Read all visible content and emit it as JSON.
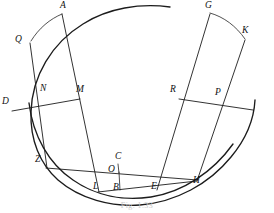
{
  "figure": {
    "caption": "Fig. 1.33",
    "stroke_color": "#1c1c1c",
    "background_color": "#ffffff",
    "width": 274,
    "height": 213
  },
  "points": [
    {
      "id": "A",
      "label": "A",
      "x": 62,
      "y": 133,
      "lx": 60,
      "ly": 2
    },
    {
      "id": "Q",
      "label": "Q",
      "x": 30,
      "y": 111,
      "lx": 17,
      "ly": 37
    },
    {
      "id": "D",
      "label": "D",
      "x": 11,
      "y": 79,
      "lx": 3,
      "ly": 97
    },
    {
      "id": "N",
      "label": "N",
      "x": 46,
      "y": 82,
      "lx": 41,
      "ly": 85
    },
    {
      "id": "M",
      "label": "M",
      "x": 79,
      "y": 85,
      "lx": 78,
      "ly": 85
    },
    {
      "id": "Z",
      "label": "Z",
      "x": 43,
      "y": 29,
      "lx": 36,
      "ly": 156
    },
    {
      "id": "L",
      "label": "L",
      "x": 98,
      "y": 19,
      "lx": 94,
      "ly": 182
    },
    {
      "id": "B",
      "label": "B",
      "x": 118,
      "y": 15,
      "lx": 113,
      "ly": 183
    },
    {
      "id": "C",
      "label": "C",
      "x": 118,
      "y": 33,
      "lx": 117,
      "ly": 152
    },
    {
      "id": "O",
      "label": "O",
      "x": 113,
      "y": 24,
      "lx": 110,
      "ly": 166
    },
    {
      "id": "E",
      "label": "E",
      "x": 156,
      "y": 19,
      "lx": 152,
      "ly": 182
    },
    {
      "id": "H",
      "label": "H",
      "x": 196,
      "y": 29,
      "lx": 194,
      "ly": 176
    },
    {
      "id": "R",
      "label": "R",
      "x": 178,
      "y": 85,
      "lx": 172,
      "ly": 85
    },
    {
      "id": "P",
      "label": "P",
      "x": 219,
      "y": 88,
      "lx": 216,
      "ly": 88
    },
    {
      "id": "G",
      "label": "G",
      "x": 209,
      "y": 133,
      "lx": 206,
      "ly": 2
    },
    {
      "id": "K",
      "label": "K",
      "x": 245,
      "y": 112,
      "lx": 243,
      "ly": 26
    }
  ],
  "arcs": [
    {
      "name": "main-circle-arc",
      "d": "M 171,4 A 105,105 0 1 0 252,126"
    },
    {
      "name": "inner-arc-left",
      "d": "M 23,55 A 108,108 0 0 0 138,190"
    },
    {
      "name": "inner-arc-right",
      "d": "M 138,190 A 108,108 0 0 0 243,121"
    }
  ],
  "segments": [
    {
      "name": "segment-A-L",
      "from": "A",
      "to": "L"
    },
    {
      "name": "segment-Q-Z",
      "from": "Q",
      "to": "Z"
    },
    {
      "name": "segment-A-Q",
      "from": "A",
      "to": "Q"
    },
    {
      "name": "segment-D-M",
      "from": "D",
      "to": "M"
    },
    {
      "name": "segment-Z-C",
      "from": "Z",
      "to": "C"
    },
    {
      "name": "segment-C-H",
      "from": "C",
      "to": "H"
    },
    {
      "name": "segment-L-B",
      "from": "L",
      "to": "B"
    },
    {
      "name": "segment-B-E",
      "from": "B",
      "to": "E"
    },
    {
      "name": "segment-E-H",
      "from": "E",
      "to": "H"
    },
    {
      "name": "segment-O-B",
      "from": "O",
      "to": "B"
    },
    {
      "name": "segment-G-E",
      "from": "G",
      "to": "E"
    },
    {
      "name": "segment-K-H",
      "from": "K",
      "to": "H"
    },
    {
      "name": "segment-G-K",
      "from": "G",
      "to": "K"
    },
    {
      "name": "segment-R-P-ext",
      "from": "R",
      "to": "P"
    }
  ]
}
